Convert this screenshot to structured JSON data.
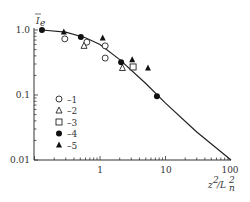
{
  "chart_data": {
    "type": "scatter",
    "title": "",
    "xlabel": "z²/L_n²",
    "ylabel": "Ī_e",
    "xscale": "log",
    "yscale": "log",
    "xlim": [
      0.1,
      100
    ],
    "ylim": [
      0.01,
      1.3
    ],
    "x_ticks": [
      "1",
      "10",
      "100"
    ],
    "y_ticks": [
      "1.0",
      "0.1",
      "0.01"
    ],
    "grid": false,
    "legend_position": "inside-lower-left",
    "series": [
      {
        "name": "–1",
        "marker": "open-circle",
        "points": [
          [
            0.29,
            0.73
          ],
          [
            0.63,
            0.65
          ],
          [
            1.2,
            0.57
          ],
          [
            1.2,
            0.37
          ]
        ]
      },
      {
        "name": "–2",
        "marker": "open-triangle",
        "points": [
          [
            0.57,
            0.57
          ],
          [
            2.2,
            0.26
          ]
        ]
      },
      {
        "name": "–3",
        "marker": "open-square",
        "points": [
          [
            3.2,
            0.27
          ]
        ]
      },
      {
        "name": "–4",
        "marker": "filled-circle",
        "points": [
          [
            0.13,
            1.0
          ],
          [
            0.51,
            0.78
          ],
          [
            2.1,
            0.32
          ],
          [
            7.4,
            0.096
          ]
        ]
      },
      {
        "name": "–5",
        "marker": "filled-triangle",
        "points": [
          [
            0.28,
            0.93
          ],
          [
            1.1,
            0.75
          ],
          [
            3.1,
            0.35
          ],
          [
            5.4,
            0.26
          ]
        ]
      }
    ],
    "curve": {
      "name": "theory",
      "points": [
        [
          0.13,
          1.0
        ],
        [
          0.3,
          0.93
        ],
        [
          0.6,
          0.76
        ],
        [
          1.0,
          0.6
        ],
        [
          2.0,
          0.35
        ],
        [
          5.0,
          0.15
        ],
        [
          10,
          0.075
        ],
        [
          30,
          0.027
        ],
        [
          100,
          0.01
        ]
      ]
    }
  }
}
